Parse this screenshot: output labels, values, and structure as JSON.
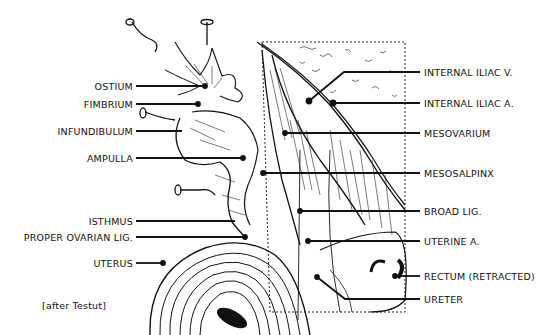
{
  "figure": {
    "caption": "[after Testut]",
    "labels_left": [
      {
        "id": "ostium",
        "text": "OSTIUM",
        "y": 86,
        "target": [
          205,
          86
        ]
      },
      {
        "id": "fimbrium",
        "text": "FIMBRIUM",
        "y": 104,
        "target": [
          198,
          104
        ]
      },
      {
        "id": "infundibulum",
        "text": "INFUNDIBULUM",
        "y": 131,
        "target": [
          182,
          131
        ]
      },
      {
        "id": "ampulla",
        "text": "AMPULLA",
        "y": 158,
        "target": [
          243,
          158
        ]
      },
      {
        "id": "isthmus",
        "text": "ISTHMUS",
        "y": 221,
        "target": [
          235,
          221
        ]
      },
      {
        "id": "proper-ovarian-lig",
        "text": "PROPER OVARIAN LIG.",
        "y": 237,
        "target": [
          245,
          237
        ]
      },
      {
        "id": "uterus",
        "text": "UTERUS",
        "y": 263,
        "target": [
          163,
          263
        ]
      }
    ],
    "labels_right": [
      {
        "id": "internal-iliac-v",
        "text": "INTERNAL ILIAC V.",
        "y": 72,
        "target": [
          309,
          101
        ],
        "elbow": [
          344,
          72
        ]
      },
      {
        "id": "internal-iliac-a",
        "text": "INTERNAL ILIAC A.",
        "y": 103,
        "target": [
          333,
          103
        ]
      },
      {
        "id": "mesovarium",
        "text": "MESOVARIUM",
        "y": 133,
        "target": [
          285,
          133
        ]
      },
      {
        "id": "mesosalpinx",
        "text": "MESOSALPINX",
        "y": 173,
        "target": [
          263,
          173
        ]
      },
      {
        "id": "broad-lig",
        "text": "BROAD LIG.",
        "y": 211,
        "target": [
          300,
          211
        ]
      },
      {
        "id": "uterine-a",
        "text": "UTERINE A.",
        "y": 241,
        "target": [
          308,
          241
        ]
      },
      {
        "id": "rectum-retracted",
        "text": "RECTUM (RETRACTED)",
        "y": 276,
        "target": [
          395,
          276
        ]
      },
      {
        "id": "ureter",
        "text": "URETER",
        "y": 299,
        "target": [
          317,
          277
        ],
        "elbow": [
          345,
          299
        ]
      }
    ]
  }
}
